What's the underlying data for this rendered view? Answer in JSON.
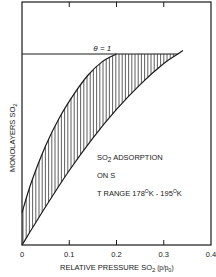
{
  "chart_data": {
    "type": "area",
    "title": "",
    "xlabel": "RELATIVE PRESSURE SO",
    "xlabel_sub": "2",
    "xlabel_suffix": " (p/p",
    "xlabel_suffix_sub": "0",
    "xlabel_close": ")",
    "ylabel": "MONOLAYERS SO",
    "ylabel_sub": "2",
    "xlim": [
      0,
      0.4
    ],
    "ylim": [
      0,
      1.27
    ],
    "x_ticks": [
      0,
      0.1,
      0.2,
      0.3,
      0.4
    ],
    "x_tick_labels": [
      "0",
      "0.1",
      "0.2",
      "0.3",
      "0.4"
    ],
    "grid": false,
    "reference_line": {
      "label": "θ = 1",
      "y": 1
    },
    "series": [
      {
        "name": "upper bound",
        "x": [
          0,
          0.02,
          0.05,
          0.08,
          0.11,
          0.14,
          0.17,
          0.2
        ],
        "y": [
          0.17,
          0.33,
          0.52,
          0.67,
          0.79,
          0.89,
          0.96,
          1.0
        ]
      },
      {
        "name": "lower bound",
        "x": [
          0,
          0.05,
          0.1,
          0.15,
          0.2,
          0.25,
          0.3,
          0.33
        ],
        "y": [
          0,
          0.2,
          0.39,
          0.56,
          0.71,
          0.84,
          0.95,
          1.0
        ]
      }
    ],
    "annotation": {
      "line1": "SO",
      "line1_sub": "2",
      "line1_rest": " ADSORPTION",
      "line2": "ON S",
      "line3_a": "T RANGE 178",
      "line3_deg1": "O",
      "line3_b": "K - 195",
      "line3_deg2": "O",
      "line3_c": "K"
    }
  }
}
